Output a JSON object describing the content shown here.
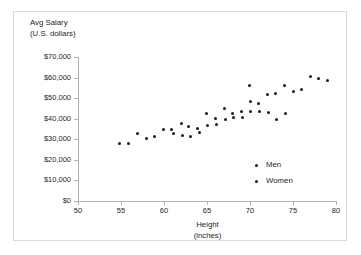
{
  "chart_data": {
    "type": "scatter",
    "title": "",
    "xlabel": "Height",
    "xlabel_units": "(inches)",
    "ylabel": "Avg Salary",
    "ylabel_units": "(U.S. dollars)",
    "xlim": [
      50,
      80
    ],
    "ylim": [
      0,
      70000
    ],
    "xticks": [
      50,
      55,
      60,
      65,
      70,
      75,
      80
    ],
    "xtick_labels": [
      "50",
      "55",
      "60",
      "65",
      "70",
      "75",
      "80"
    ],
    "yticks": [
      0,
      10000,
      20000,
      30000,
      40000,
      50000,
      60000,
      70000
    ],
    "ytick_labels": [
      "$0",
      "$10,000",
      "$20,000",
      "$30,000",
      "$40,000",
      "$50,000",
      "$60,000",
      "$70,000"
    ],
    "grid": false,
    "legend_position": "inside-lower-right",
    "marker_color": "#1a1a1a",
    "axis_color": "#b3b3b3",
    "legend": [
      {
        "name": "Men",
        "marker_color": "#1a1a1a"
      },
      {
        "name": "Women",
        "marker_color": "#1a1a1a"
      }
    ],
    "points": [
      {
        "x": 54.8,
        "y": 28000
      },
      {
        "x": 55.9,
        "y": 27800
      },
      {
        "x": 56.9,
        "y": 33000
      },
      {
        "x": 58.0,
        "y": 30200
      },
      {
        "x": 58.9,
        "y": 31200
      },
      {
        "x": 59.9,
        "y": 35000
      },
      {
        "x": 60.9,
        "y": 34900
      },
      {
        "x": 61.1,
        "y": 32800
      },
      {
        "x": 62.0,
        "y": 37500
      },
      {
        "x": 62.1,
        "y": 32000
      },
      {
        "x": 62.9,
        "y": 36000
      },
      {
        "x": 63.1,
        "y": 31200
      },
      {
        "x": 63.9,
        "y": 35200
      },
      {
        "x": 64.1,
        "y": 33300
      },
      {
        "x": 64.9,
        "y": 42500
      },
      {
        "x": 65.0,
        "y": 36700
      },
      {
        "x": 66.0,
        "y": 40200
      },
      {
        "x": 66.1,
        "y": 37400
      },
      {
        "x": 67.0,
        "y": 45200
      },
      {
        "x": 67.1,
        "y": 39800
      },
      {
        "x": 68.0,
        "y": 42700
      },
      {
        "x": 68.1,
        "y": 40500
      },
      {
        "x": 69.0,
        "y": 43400
      },
      {
        "x": 69.1,
        "y": 40600
      },
      {
        "x": 69.9,
        "y": 56200
      },
      {
        "x": 70.0,
        "y": 48200
      },
      {
        "x": 70.1,
        "y": 43300
      },
      {
        "x": 71.0,
        "y": 47500
      },
      {
        "x": 71.1,
        "y": 43300
      },
      {
        "x": 72.0,
        "y": 52000
      },
      {
        "x": 72.1,
        "y": 42900
      },
      {
        "x": 73.0,
        "y": 52300
      },
      {
        "x": 73.1,
        "y": 39400
      },
      {
        "x": 74.0,
        "y": 56000
      },
      {
        "x": 74.1,
        "y": 42400
      },
      {
        "x": 75.0,
        "y": 53300
      },
      {
        "x": 76.0,
        "y": 54200
      },
      {
        "x": 77.0,
        "y": 60300
      },
      {
        "x": 78.0,
        "y": 59400
      },
      {
        "x": 79.0,
        "y": 58700
      }
    ]
  }
}
